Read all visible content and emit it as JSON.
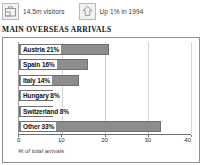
{
  "header": {
    "stats": [
      {
        "icon": "suitcase-icon",
        "label": "14.5m visitors"
      },
      {
        "icon": "arrow-up-icon",
        "label": "Up 1% in 1994"
      }
    ]
  },
  "section": {
    "title": "MAIN OVERSEAS ARRIVALS"
  },
  "colors": {
    "bar_fill": "#8d8d8d",
    "bar_stroke": "#6f6f6f",
    "frame_border": "#8e8e8e",
    "gridline": "#d4d4d4"
  },
  "chart_data": {
    "type": "bar",
    "orientation": "horizontal",
    "title": "MAIN OVERSEAS ARRIVALS",
    "xlabel": "% of total arrivals",
    "ylabel": "",
    "xlim": [
      0,
      40
    ],
    "xticks": [
      "0",
      "10",
      "20",
      "30",
      "40"
    ],
    "grid": true,
    "legend": "none",
    "categories": [
      "Austria",
      "Spain",
      "Italy",
      "Hungary",
      "Switzerland",
      "Other"
    ],
    "values": [
      21,
      16,
      14,
      8,
      8,
      33
    ],
    "bar_labels": [
      "Austria 21%",
      "Spain 16%",
      "Italy 14%",
      "Hungary 8%",
      "Switzerland 8%",
      "Other 33%"
    ]
  }
}
